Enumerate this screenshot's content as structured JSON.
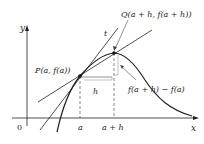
{
  "diagram": {
    "axes": {
      "x_label": "x",
      "y_label": "y",
      "origin_label": "0"
    },
    "points": {
      "P": {
        "label": "P(a, f(a))"
      },
      "Q": {
        "label": "Q(a + h, f(a + h))"
      }
    },
    "tangent_label": "t",
    "ticks": {
      "a": "a",
      "a_plus_h": "a + h"
    },
    "h_label": "h",
    "rise_label": "f(a + h) − f(a)",
    "colors": {
      "curve": "#222222",
      "dashed": "#555555",
      "background": "#ffffff"
    }
  }
}
